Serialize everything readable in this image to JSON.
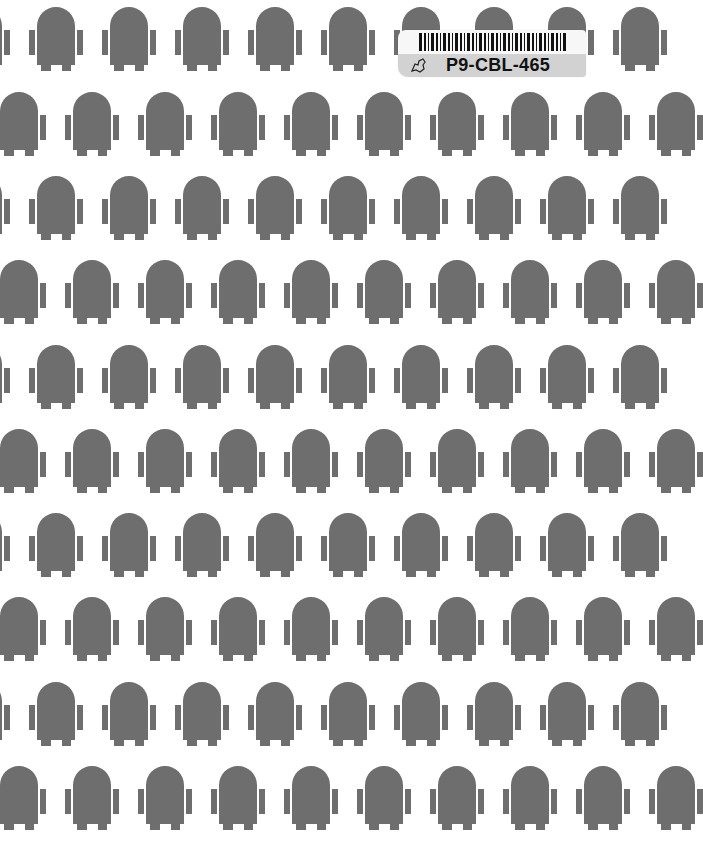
{
  "page": {
    "background": "#ffffff",
    "pattern_color": "#6e6e6e",
    "pattern": {
      "motif": "robot-icon",
      "row_tops": [
        7,
        92,
        176,
        260,
        345,
        429,
        513,
        597,
        682,
        766
      ],
      "column_pitch": 73,
      "even_row_offset_x": -37,
      "odd_row_start_x": 29,
      "robot_width": 54,
      "robot_height": 70
    }
  },
  "library_label": {
    "barcode_icon": "barcode-icon",
    "logo_icon": "map-outline-icon",
    "code": "P9-CBL-465"
  }
}
